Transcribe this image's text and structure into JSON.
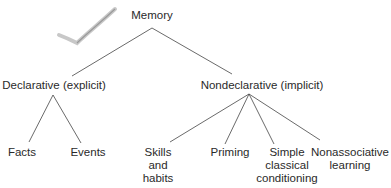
{
  "diagram": {
    "type": "tree",
    "root": {
      "label": "Memory"
    },
    "branches": [
      {
        "label": "Declarative (explicit)",
        "children": [
          {
            "label": "Facts"
          },
          {
            "label": "Events"
          }
        ]
      },
      {
        "label": "Nondeclarative (implicit)",
        "children": [
          {
            "label": "Skills\nand\nhabits",
            "lines": [
              "Skills",
              "and",
              "habits"
            ]
          },
          {
            "label": "Priming",
            "lines": [
              "Priming"
            ]
          },
          {
            "label": "Simple classical conditioning",
            "lines": [
              "Simple",
              "classical",
              "conditioning"
            ]
          },
          {
            "label": "Nonassociative learning",
            "lines": [
              "Nonassociative",
              "learning"
            ]
          }
        ]
      }
    ]
  },
  "decoration": {
    "checkmark": "checkmark-icon"
  }
}
